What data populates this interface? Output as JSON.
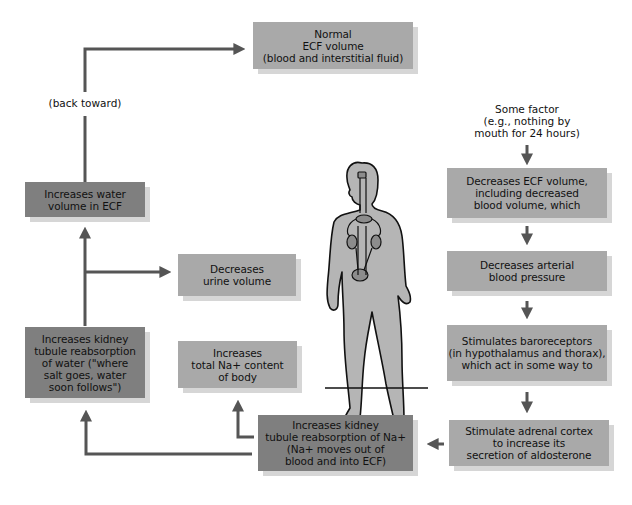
{
  "colors": {
    "light_box": "#a9a9a9",
    "dark_box": "#7f7f7f",
    "arrow": "#555555",
    "body_fill": "#b5b5b5"
  },
  "boxes": {
    "normal_ecf": {
      "lines": [
        "Normal",
        "ECF volume",
        "(blood and interstitial fluid)"
      ],
      "shade": "light"
    },
    "increases_water_volume": {
      "lines": [
        "Increases water",
        "volume in ECF"
      ],
      "shade": "dark"
    },
    "decreases_urine": {
      "lines": [
        "Decreases",
        "urine volume"
      ],
      "shade": "light"
    },
    "kidney_water": {
      "lines": [
        "Increases kidney",
        "tubule reabsorption",
        "of water (\"where",
        "salt goes, water",
        "soon follows\")"
      ],
      "shade": "dark"
    },
    "total_na": {
      "lines": [
        "Increases",
        "total Na+ content",
        "of body"
      ],
      "shade": "light"
    },
    "kidney_na": {
      "lines": [
        "Increases kidney",
        "tubule reabsorption of Na+",
        "(Na+ moves out of",
        "blood and into ECF)"
      ],
      "shade": "dark"
    },
    "decreases_ecf": {
      "lines": [
        "Decreases ECF volume,",
        "including decreased",
        "blood volume, which"
      ],
      "shade": "light"
    },
    "decreases_bp": {
      "lines": [
        "Decreases arterial",
        "blood pressure"
      ],
      "shade": "light"
    },
    "baroreceptors": {
      "lines": [
        "Stimulates baroreceptors",
        "(in hypothalamus and thorax),",
        "which act in some way to"
      ],
      "shade": "light"
    },
    "adrenal": {
      "lines": [
        "Stimulate adrenal cortex",
        "to increase its",
        "secretion of aldosterone"
      ],
      "shade": "light"
    }
  },
  "labels": {
    "back_toward": "(back toward)",
    "some_factor": [
      "Some factor",
      "(e.g., nothing by",
      "mouth for 24 hours)"
    ]
  },
  "figure": {
    "icon": "human-body-with-kidneys-icon"
  }
}
